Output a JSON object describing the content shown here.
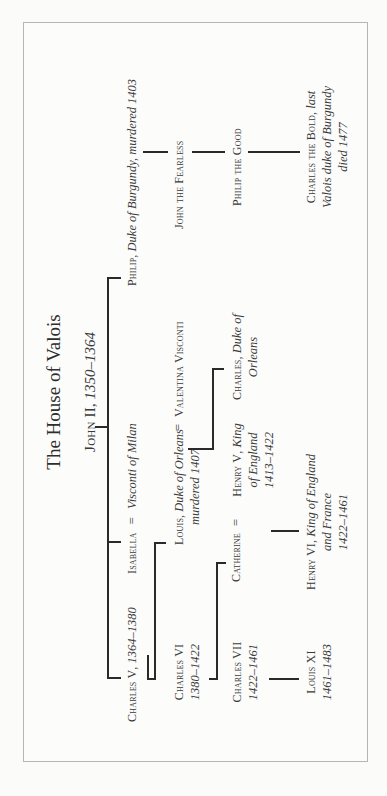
{
  "title": "The House of Valois",
  "root": {
    "name": "John II",
    "dates": "1350–1364"
  },
  "people": {
    "charles_v": {
      "name": "Charles V",
      "dates": "1364–1380"
    },
    "isabella": {
      "name": "Isabella",
      "eq": "=",
      "spouse": "Visconti of Milan"
    },
    "philip_burgundy": {
      "name": "Philip",
      "desc": "Duke of Burgundy, murdered 1403"
    },
    "charles_vi": {
      "name": "Charles VI",
      "dates": "1380–1422"
    },
    "louis_orleans": {
      "name": "Louis",
      "desc1": "Duke of Orleans",
      "desc2": "murdered 1407",
      "eq": "="
    },
    "valentina": {
      "name": "Valentina Visconti"
    },
    "john_fearless": {
      "name": "John the Fearless"
    },
    "charles_vii": {
      "name": "Charles VII",
      "dates": "1422–1461"
    },
    "catherine": {
      "name": "Catherine",
      "eq": "="
    },
    "henry_v": {
      "name": "Henry V",
      "desc1": "King",
      "desc2": "of England",
      "dates": "1413–1422"
    },
    "charles_orleans": {
      "name": "Charles",
      "desc1": "Duke of",
      "desc2": "Orleans"
    },
    "philip_good": {
      "name": "Philip the Good"
    },
    "louis_xi": {
      "name": "Louis XI",
      "dates": "1461–1483"
    },
    "henry_vi": {
      "name": "Henry VI",
      "desc1": "King of England",
      "desc2": "and France",
      "dates": "1422–1461"
    },
    "charles_bold": {
      "name": "Charles the Bold",
      "desc1": "last",
      "desc2": "Valois duke of Burgundy",
      "desc3": "died 1477"
    }
  },
  "colors": {
    "ink": "#2a2a2a",
    "text": "#3a3a3a",
    "border": "#b5b5b5",
    "paper": "#fcfcfb"
  }
}
